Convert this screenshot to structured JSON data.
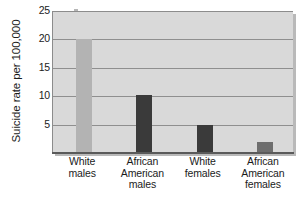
{
  "chart_data": {
    "type": "bar",
    "title": "",
    "xlabel": "",
    "ylabel": "Suicide rate per 100,000",
    "ylim": [
      0,
      25
    ],
    "yticks": [
      5,
      10,
      15,
      20,
      25
    ],
    "ytick_labels": [
      "5",
      "10",
      "15",
      "20",
      "25"
    ],
    "grid": true,
    "legend": "none",
    "categories": [
      "White males",
      "African American males",
      "White females",
      "African American females"
    ],
    "category_lines": [
      [
        "White",
        "males"
      ],
      [
        "African",
        "American",
        "males"
      ],
      [
        "White",
        "females"
      ],
      [
        "African",
        "American",
        "females"
      ]
    ],
    "values": [
      20.0,
      10.3,
      5.0,
      2.0
    ],
    "bar_colors": [
      "#b3b3b3",
      "#3a3a3a",
      "#3a3a3a",
      "#6e6e6e"
    ],
    "plot_background": "#d9d9d9",
    "gridline_color": "#8f8f8f",
    "axis_color": "#5a5a5a",
    "text_color": "#1b1b1b"
  }
}
